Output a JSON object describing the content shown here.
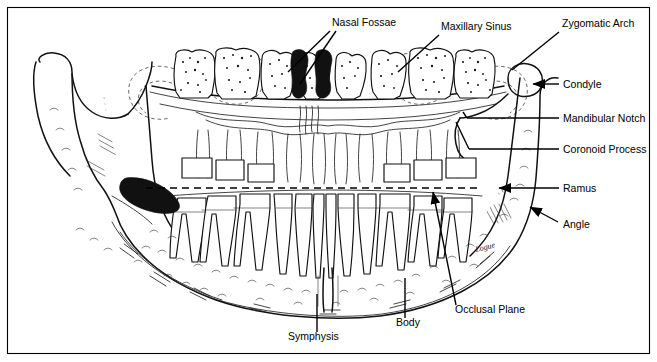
{
  "figure": {
    "border_color": "#000000",
    "ink_color": "#111111",
    "background": "#ffffff",
    "signature": "Logue"
  },
  "labels": [
    {
      "id": "nasal-fossae",
      "text": "Nasal Fossae",
      "x": 332,
      "y": 26,
      "anchor": "start",
      "leaders": [
        {
          "x1": 330,
          "y1": 31,
          "x2": 288,
          "y2": 72
        },
        {
          "x1": 336,
          "y1": 31,
          "x2": 300,
          "y2": 84
        }
      ],
      "arrow": false
    },
    {
      "id": "maxillary-sinus",
      "text": "Maxillary Sinus",
      "x": 441,
      "y": 30,
      "anchor": "start",
      "leaders": [
        {
          "x1": 439,
          "y1": 35,
          "x2": 398,
          "y2": 72
        }
      ],
      "arrow": false
    },
    {
      "id": "zygomatic-arch",
      "text": "Zygomatic Arch",
      "x": 562,
      "y": 27,
      "anchor": "start",
      "leaders": [
        {
          "x1": 559,
          "y1": 32,
          "x2": 512,
          "y2": 70
        }
      ],
      "arrow": false
    },
    {
      "id": "condyle",
      "text": "Condyle",
      "x": 563,
      "y": 88,
      "anchor": "start",
      "leaders": [
        {
          "x1": 559,
          "y1": 84,
          "x2": 531,
          "y2": 84
        }
      ],
      "arrow": true
    },
    {
      "id": "mandibular-notch",
      "text": "Mandibular Notch",
      "x": 563,
      "y": 122,
      "anchor": "start",
      "leaders": [
        {
          "x1": 559,
          "y1": 118,
          "x2": 467,
          "y2": 118
        }
      ],
      "arrow": false
    },
    {
      "id": "coronoid-process",
      "text": "Coronoid Process",
      "x": 563,
      "y": 153,
      "anchor": "start",
      "leaders": [
        {
          "x1": 559,
          "y1": 149,
          "x2": 469,
          "y2": 149
        }
      ],
      "arrow": false
    },
    {
      "id": "ramus",
      "text": "Ramus",
      "x": 563,
      "y": 192,
      "anchor": "start",
      "leaders": [
        {
          "x1": 559,
          "y1": 188,
          "x2": 497,
          "y2": 188
        }
      ],
      "arrow": true
    },
    {
      "id": "angle",
      "text": "Angle",
      "x": 563,
      "y": 228,
      "anchor": "start",
      "leaders": [
        {
          "x1": 558,
          "y1": 222,
          "x2": 528,
          "y2": 206
        }
      ],
      "arrow": true
    },
    {
      "id": "occlusal-plane",
      "text": "Occlusal Plane",
      "x": 455,
      "y": 313,
      "anchor": "start",
      "leaders": [
        {
          "x1": 456,
          "y1": 305,
          "x2": 432,
          "y2": 190
        }
      ],
      "arrow": true
    },
    {
      "id": "body",
      "text": "Body",
      "x": 396,
      "y": 326,
      "anchor": "start",
      "leaders": [
        {
          "x1": 405,
          "y1": 318,
          "x2": 405,
          "y2": 278
        }
      ],
      "arrow": false
    },
    {
      "id": "symphysis",
      "text": "Symphysis",
      "x": 288,
      "y": 340,
      "anchor": "start",
      "leaders": [
        {
          "x1": 317,
          "y1": 332,
          "x2": 317,
          "y2": 294
        }
      ],
      "arrow": false
    }
  ]
}
